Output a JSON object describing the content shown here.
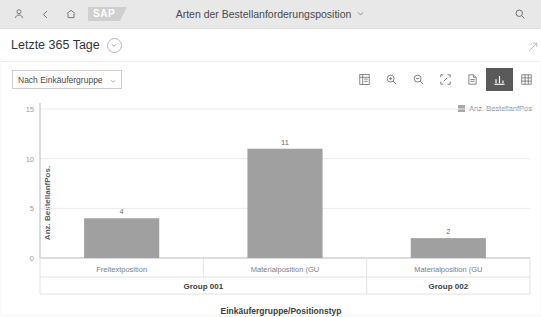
{
  "shellbar": {
    "title": "Arten der Bestellanforderungsposition",
    "icons": {
      "user": "user-icon",
      "back": "back-chevron-icon",
      "home": "home-icon",
      "logo": "SAP",
      "title_chevron": "chevron-down-icon",
      "search": "search-icon"
    }
  },
  "page_header": {
    "title": "Letzte 365 Tage",
    "chevron": "chevron-down-icon"
  },
  "toolbar": {
    "dimension_select": {
      "value": "Nach Einkäufergruppe",
      "chevron": "chevron-down-icon"
    },
    "buttons": [
      {
        "name": "details-icon",
        "label": "Details",
        "active": false
      },
      {
        "name": "zoom-in-icon",
        "label": "Zoom In",
        "active": false
      },
      {
        "name": "zoom-out-icon",
        "label": "Zoom Out",
        "active": false
      },
      {
        "name": "fullscreen-icon",
        "label": "Vollbild",
        "active": false
      },
      {
        "name": "export-icon",
        "label": "Exportieren",
        "active": false
      },
      {
        "name": "bar-chart-icon",
        "label": "Diagramm",
        "active": true
      },
      {
        "name": "table-grid-icon",
        "label": "Tabelle",
        "active": false
      }
    ]
  },
  "legend": {
    "items": [
      {
        "label": "Anz. BestellanfPos",
        "color": "#a8a8a8"
      }
    ]
  },
  "chart_data": {
    "type": "bar",
    "title": "",
    "xlabel": "Einkäufergruppe/Positionstyp",
    "ylabel": "Anz. BestellanfPos.",
    "ylim": [
      0,
      15
    ],
    "yticks": [
      0,
      5,
      10,
      15
    ],
    "ytick_labels": [
      "0",
      "5",
      "10",
      "15"
    ],
    "grid": true,
    "legend_position": "top-right",
    "bar_color": "#a0a0a0",
    "categories": [
      "Freitextposition",
      "Materialposition (GU",
      "Materialposition (GU"
    ],
    "values": [
      4,
      11,
      2
    ],
    "value_labels": [
      "4",
      "11",
      "2"
    ],
    "groups": [
      {
        "label": "Group 001",
        "span": 2
      },
      {
        "label": "Group 002",
        "span": 1
      }
    ],
    "series": [
      {
        "name": "Anz. BestellanfPos",
        "values": [
          4,
          11,
          2
        ]
      }
    ]
  }
}
